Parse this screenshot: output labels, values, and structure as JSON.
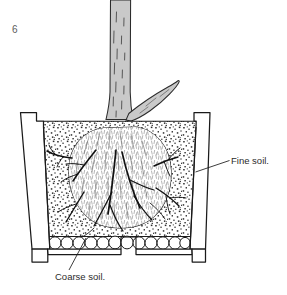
{
  "figure": {
    "number": "6",
    "caption_labels": {
      "fine_soil": "Fine soil.",
      "coarse_soil": "Coarse soil."
    },
    "canvas": {
      "width": 287,
      "height": 295,
      "background": "#ffffff"
    }
  },
  "colors": {
    "ink": "#1a1a1a",
    "stem_fill": "#c9c9c9",
    "stem_fill_light": "#d6d6d6",
    "soil_dot": "#2b2b2b",
    "pot_fill": "#ffffff",
    "rootball_fill": "#ffffff",
    "pebble_fill": "#ffffff",
    "figure_number": "#5c5c5c",
    "label_text": "#2b2b2b"
  },
  "elements": {
    "pot": "flower-pot-cross-section",
    "pot_rim_left": "pot-rim-left",
    "pot_rim_right": "pot-rim-right",
    "pot_base": "pot-base-with-feet",
    "drain_hole": "drainage-hole",
    "fine_soil_region": "stippled-fine-soil",
    "coarse_soil_region": "pebble-layer",
    "root_ball": "root-ball",
    "roots": "radiating-roots",
    "stem": "main-stem",
    "branch": "side-branch",
    "leader_fine": "leader-line-fine-soil",
    "leader_coarse": "leader-line-coarse-soil"
  }
}
